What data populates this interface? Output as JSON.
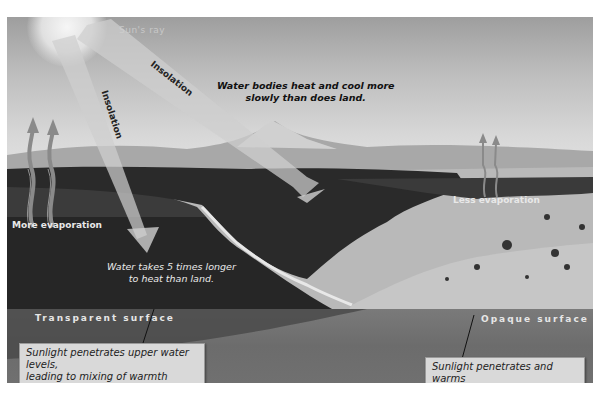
{
  "figure": {
    "sun_label": "Sun's ray",
    "beams": [
      {
        "label": "Insolation",
        "target": "land"
      },
      {
        "label": "Insolation",
        "target": "water"
      }
    ],
    "top_caption": [
      "Water bodies heat and cool more",
      "slowly than does land."
    ],
    "water_caption": [
      "Water takes 5 times longer",
      "to heat than land."
    ],
    "evaporation_water": "More evaporation",
    "evaporation_land": "Less evaporation",
    "surface_water": "Transparent surface",
    "surface_land": "Opaque surface",
    "callout_water": [
      "Sunlight penetrates upper water levels,",
      "leading to mixing of warmth"
    ],
    "callout_land": [
      "Sunlight penetrates and warms",
      "only a few inches of soil"
    ],
    "colors": {
      "sky": "#c8c8c8",
      "water": "#1f1f1f",
      "ground_band": "#6e6e6e",
      "beam": "#c8c8c8",
      "callout_bg": "#d9d9d9",
      "arrow": "#8a8a8a"
    }
  }
}
